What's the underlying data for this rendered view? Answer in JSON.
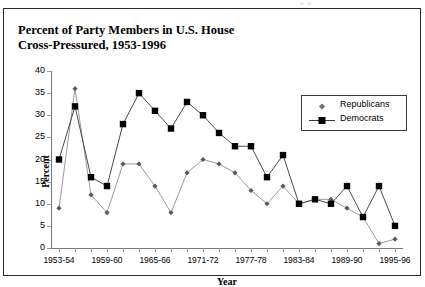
{
  "page": {
    "bleed_text": "o   o"
  },
  "chart_data": {
    "type": "line",
    "title": "Percent of Party Members in U.S. House Cross-Pressured, 1953-1996",
    "title_lines": [
      "Percent of Party Members in U.S. House",
      "Cross-Pressured, 1953-1996"
    ],
    "xlabel": "Year",
    "ylabel": "Percent",
    "ylim": [
      0,
      40
    ],
    "yticks": [
      0,
      5,
      10,
      15,
      20,
      25,
      30,
      35,
      40
    ],
    "grid": false,
    "legend_position": "top-right",
    "categories": [
      "1953-54",
      "1955-56",
      "1957-58",
      "1959-60",
      "1961-62",
      "1963-64",
      "1965-66",
      "1967-68",
      "1969-70",
      "1971-72",
      "1973-74",
      "1975-76",
      "1977-78",
      "1979-80",
      "1981-82",
      "1983-84",
      "1985-86",
      "1987-88",
      "1989-90",
      "1991-92",
      "1993-94",
      "1995-96"
    ],
    "xtick_labels": [
      "1953-54",
      "1959-60",
      "1965-66",
      "1971-72",
      "1977-78",
      "1983-84",
      "1989-90",
      "1995-96"
    ],
    "series": [
      {
        "name": "Republicans",
        "marker": "diamond",
        "color": "#808080",
        "values": [
          9,
          36,
          12,
          8,
          19,
          19,
          14,
          8,
          17,
          20,
          19,
          17,
          13,
          10,
          14,
          10,
          11,
          11,
          9,
          7,
          1,
          2
        ]
      },
      {
        "name": "Democrats",
        "marker": "square",
        "color": "#000000",
        "values": [
          20,
          32,
          16,
          14,
          28,
          35,
          31,
          27,
          33,
          30,
          26,
          23,
          23,
          16,
          21,
          10,
          11,
          10,
          14,
          7,
          14,
          5
        ]
      }
    ]
  }
}
